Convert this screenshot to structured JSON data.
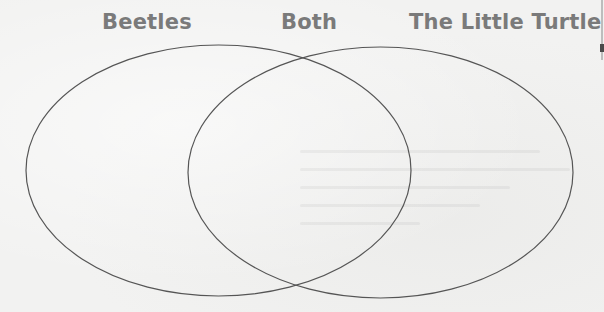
{
  "diagram": {
    "type": "venn",
    "sets": [
      {
        "name": "Beetles",
        "position": "left"
      },
      {
        "name": "The Little Turtle",
        "position": "right"
      }
    ],
    "intersection_label": "Both",
    "labels": {
      "left": "Beetles",
      "middle": "Both",
      "right": "The Little Turtle"
    },
    "regions": {
      "left_only": [],
      "both": [],
      "right_only": []
    },
    "colors": {
      "label_text": "#7a7a7a",
      "outline": "#555555",
      "background": "#f2f2f1"
    }
  }
}
